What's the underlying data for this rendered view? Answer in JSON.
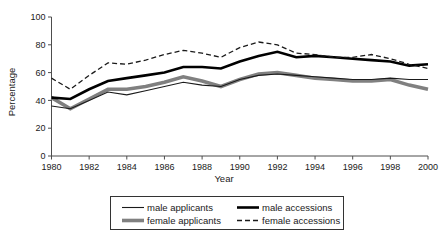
{
  "chart_data": {
    "type": "line",
    "title": "",
    "xlabel": "Year",
    "ylabel": "Percentage",
    "xlim": [
      1980,
      2000
    ],
    "ylim": [
      0,
      100
    ],
    "xticks": [
      1980,
      1982,
      1984,
      1986,
      1988,
      1990,
      1992,
      1994,
      1996,
      1998,
      2000
    ],
    "yticks": [
      0,
      20,
      40,
      60,
      80,
      100
    ],
    "grid": false,
    "legend_position": "bottom",
    "x": [
      1980,
      1981,
      1982,
      1983,
      1984,
      1985,
      1986,
      1987,
      1988,
      1989,
      1990,
      1991,
      1992,
      1993,
      1994,
      1995,
      1996,
      1997,
      1998,
      1999,
      2000
    ],
    "series": [
      {
        "name": "male applicants",
        "style": "thin-solid-black",
        "color": "#1a1a1a",
        "width": 1.1,
        "dash": "none",
        "values": [
          36,
          34,
          40,
          46,
          44,
          47,
          50,
          53,
          51,
          50,
          55,
          58,
          59,
          58,
          57,
          56,
          55,
          55,
          56,
          55,
          55
        ]
      },
      {
        "name": "male accessions",
        "style": "thick-solid-black",
        "color": "#000000",
        "width": 2.6,
        "dash": "none",
        "values": [
          42,
          41,
          48,
          54,
          56,
          58,
          60,
          64,
          64,
          63,
          68,
          72,
          75,
          71,
          72,
          71,
          70,
          69,
          68,
          65,
          66
        ]
      },
      {
        "name": "female applicants",
        "style": "thick-solid-gray",
        "color": "#808080",
        "width": 3.6,
        "dash": "none",
        "values": [
          42,
          34,
          41,
          48,
          48,
          50,
          53,
          57,
          54,
          50,
          55,
          59,
          60,
          58,
          56,
          55,
          54,
          54,
          55,
          51,
          48
        ]
      },
      {
        "name": "female accessions",
        "style": "dashed-black",
        "color": "#1a1a1a",
        "width": 1.3,
        "dash": "5,3",
        "values": [
          56,
          48,
          58,
          67,
          66,
          69,
          73,
          76,
          74,
          71,
          78,
          82,
          80,
          74,
          73,
          71,
          71,
          73,
          70,
          66,
          63
        ]
      }
    ]
  },
  "legend": {
    "entries": [
      {
        "label": "male applicants",
        "key": "male-applicants"
      },
      {
        "label": "male accessions",
        "key": "male-accessions"
      },
      {
        "label": "female applicants",
        "key": "female-applicants"
      },
      {
        "label": "female accessions",
        "key": "female-accessions"
      }
    ]
  },
  "axis": {
    "y_title": "Percentage",
    "x_title": "Year",
    "y_tick_labels": [
      "100",
      "80",
      "60",
      "40",
      "20",
      "0"
    ],
    "x_tick_labels": [
      "1980",
      "1982",
      "1984",
      "1986",
      "1988",
      "1990",
      "1992",
      "1994",
      "1996",
      "1998",
      "2000"
    ]
  },
  "colors": {
    "axis": "#4d4d4d",
    "text": "#1a1a1a",
    "male_applicants": "#1a1a1a",
    "male_accessions": "#000000",
    "female_applicants": "#808080",
    "female_accessions": "#1a1a1a",
    "background": "#ffffff"
  }
}
